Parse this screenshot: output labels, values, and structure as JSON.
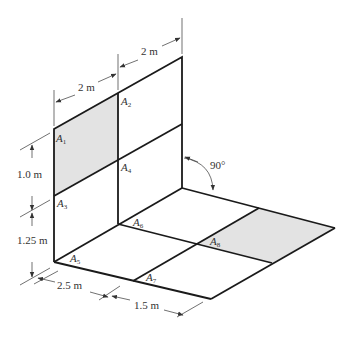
{
  "diagram": {
    "type": "isometric-composite-plate",
    "colors": {
      "line": "#1a1a1a",
      "shaded_area": "#e3e3e3",
      "text": "#333333",
      "background": "#ffffff"
    },
    "dimensions": {
      "wall_width_left": "2 m",
      "wall_width_right": "2 m",
      "wall_height_upper": "1.0 m",
      "wall_height_lower": "1.25 m",
      "floor_depth_front": "2.5 m",
      "floor_depth_back": "1.5 m",
      "angle": "90°"
    },
    "areas": [
      {
        "id": "A1",
        "letter": "A",
        "sub": "1",
        "shaded": true
      },
      {
        "id": "A2",
        "letter": "A",
        "sub": "2",
        "shaded": false
      },
      {
        "id": "A3",
        "letter": "A",
        "sub": "3",
        "shaded": false
      },
      {
        "id": "A4",
        "letter": "A",
        "sub": "4",
        "shaded": false
      },
      {
        "id": "A5",
        "letter": "A",
        "sub": "5",
        "shaded": false
      },
      {
        "id": "A6",
        "letter": "A",
        "sub": "6",
        "shaded": false
      },
      {
        "id": "A7",
        "letter": "A",
        "sub": "7",
        "shaded": false
      },
      {
        "id": "A8",
        "letter": "A",
        "sub": "8",
        "shaded": true
      }
    ]
  }
}
